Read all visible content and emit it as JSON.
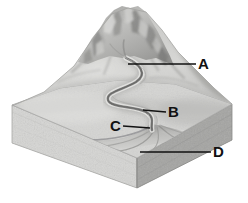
{
  "figure": {
    "kind": "geologic-block-diagram",
    "background_color": "#ffffff",
    "rendering": "grayscale pencil / airbrush shaded illustration"
  },
  "labels": [
    {
      "id": "A",
      "text": "A",
      "text_x": 198,
      "text_y": 69,
      "leader_from_x": 196,
      "leader_from_y": 64,
      "leader_to_x": 128,
      "leader_to_y": 64,
      "points_to": "upper mountain slope / headwaters"
    },
    {
      "id": "B",
      "text": "B",
      "text_x": 168,
      "text_y": 117,
      "leader_from_x": 166,
      "leader_from_y": 112,
      "leader_to_x": 143,
      "leader_to_y": 110,
      "points_to": "river meander loop"
    },
    {
      "id": "C",
      "text": "C",
      "text_x": 110,
      "text_y": 131,
      "leader_from_x": 123,
      "leader_from_y": 126,
      "leader_to_x": 150,
      "leader_to_y": 128,
      "points_to": "lower river channel above the fan"
    },
    {
      "id": "D",
      "text": "D",
      "text_x": 213,
      "text_y": 157,
      "leader_from_x": 211,
      "leader_from_y": 152,
      "leader_to_x": 140,
      "leader_to_y": 152,
      "points_to": "right cut face of the ground block"
    }
  ],
  "colors": {
    "label_ink": "#111111",
    "leader_line": "#111111",
    "block_top_light": "#d8d8d6",
    "block_top_mid": "#c4c4c2",
    "block_left_face": "#d3d3d1",
    "block_right_face": "#a6a6a4",
    "mountain_light": "#d0d0ce",
    "mountain_mid": "#b2b2b0",
    "mountain_dark": "#8a8a88",
    "mountain_shadow": "#6e6e6c",
    "river_dark": "#7a7a78",
    "river_light": "#e2e2e0",
    "outline": "#9a9a98"
  },
  "geometry": {
    "block_top_left_corner_x": 12,
    "block_top_left_corner_y": 105,
    "block_front_corner_x": 137,
    "block_front_corner_y": 158,
    "block_front_bottom_y": 188,
    "block_top_right_corner_x": 232,
    "block_top_right_corner_y": 104,
    "mountain_peak_x": 128,
    "mountain_peak_y": 9
  },
  "features": [
    {
      "name": "mountain-peak",
      "description": "craggy summit with ridges and dark shadowed gullies"
    },
    {
      "name": "mountain-flank",
      "description": "broad smooth shaded slopes descending toward the plain"
    },
    {
      "name": "meandering-river",
      "description": "sinuous S-shaped channel winding down the slope"
    },
    {
      "name": "alluvial-fan",
      "description": "fan of distributary channels spreading at the base"
    },
    {
      "name": "block-left-face",
      "description": "pale stippled sediment cut face"
    },
    {
      "name": "block-right-face",
      "description": "darker gray shaded cut face"
    }
  ]
}
